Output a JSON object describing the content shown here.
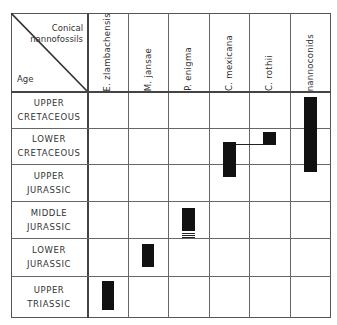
{
  "header": {
    "corner_top_line1": "Conical",
    "corner_top_line2": "nannofossils",
    "corner_age": "Age"
  },
  "columns": [
    {
      "label": "E. zlambachensis"
    },
    {
      "label": "M. jansae"
    },
    {
      "label": "P. enigma"
    },
    {
      "label": "C. mexicana"
    },
    {
      "label": "C. rothii"
    },
    {
      "label": "nannoconids"
    }
  ],
  "rows": [
    {
      "line1": "UPPER",
      "line2": "CRETACEOUS"
    },
    {
      "line1": "LOWER",
      "line2": "CRETACEOUS"
    },
    {
      "line1": "UPPER",
      "line2": "JURASSIC"
    },
    {
      "line1": "MIDDLE",
      "line2": "JURASSIC"
    },
    {
      "line1": "LOWER",
      "line2": "JURASSIC"
    },
    {
      "line1": "UPPER",
      "line2": "TRIASSIC"
    }
  ],
  "ranges": [
    {
      "taxon": "E. zlambachensis",
      "from": "Upper Triassic (middle)",
      "to": "Upper Triassic (upper)"
    },
    {
      "taxon": "M. jansae",
      "from": "Lower Jurassic (lower)",
      "to": "Lower Jurassic (upper)"
    },
    {
      "taxon": "P. enigma",
      "from": "Middle Jurassic (lower, uncertain, striped)",
      "to": "Middle Jurassic (upper)"
    },
    {
      "taxon": "C. mexicana",
      "from": "Upper Jurassic (middle)",
      "to": "Lower Cretaceous (middle)"
    },
    {
      "taxon": "C. rothii",
      "from": "Lower Cretaceous (middle)",
      "to": "Lower Cretaceous (upper)",
      "linked_to": "C. mexicana"
    },
    {
      "taxon": "nannoconids",
      "from": "Upper Jurassic (top)",
      "to": "Upper Cretaceous (upper)"
    }
  ],
  "colors": {
    "bar": "#111111",
    "grid": "#666666"
  }
}
